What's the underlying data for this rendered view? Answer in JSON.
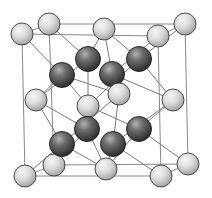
{
  "diagram": {
    "type": "crystal-unit-cell",
    "colors": {
      "background": "#ffffff",
      "edge": "#8a8a8a",
      "bond": "#7a7a7a",
      "light_atom_highlight": "#f4f4f4",
      "light_atom_shadow": "#9c9c9c",
      "dark_atom_highlight": "#a8a8a8",
      "dark_atom_shadow": "#2a2a2a"
    },
    "atom_radius": {
      "light": 11,
      "dark": 12.5
    },
    "cell_edges": [
      [
        49,
        24,
        185,
        24
      ],
      [
        22,
        34,
        158,
        36
      ],
      [
        49,
        24,
        22,
        34
      ],
      [
        185,
        24,
        158,
        36
      ],
      [
        54,
        165,
        188,
        164
      ],
      [
        25,
        176,
        161,
        176
      ],
      [
        54,
        165,
        25,
        176
      ],
      [
        188,
        164,
        161,
        176
      ],
      [
        22,
        34,
        25,
        176
      ],
      [
        49,
        24,
        54,
        165
      ],
      [
        158,
        36,
        161,
        176
      ],
      [
        185,
        24,
        188,
        164
      ]
    ],
    "bonds": [
      [
        88,
        59,
        49,
        24
      ],
      [
        88,
        59,
        104,
        29
      ],
      [
        88,
        59,
        36,
        100
      ],
      [
        88,
        59,
        88,
        106
      ],
      [
        62,
        75,
        22,
        34
      ],
      [
        62,
        75,
        36,
        100
      ],
      [
        62,
        75,
        119,
        94
      ],
      [
        62,
        75,
        88,
        106
      ],
      [
        139,
        59,
        185,
        24
      ],
      [
        139,
        59,
        104,
        29
      ],
      [
        139,
        59,
        173,
        100
      ],
      [
        139,
        59,
        88,
        106
      ],
      [
        112,
        74,
        104,
        29
      ],
      [
        112,
        74,
        158,
        36
      ],
      [
        112,
        74,
        119,
        94
      ],
      [
        112,
        74,
        173,
        100
      ],
      [
        87,
        129,
        88,
        106
      ],
      [
        87,
        129,
        36,
        100
      ],
      [
        87,
        129,
        54,
        165
      ],
      [
        87,
        129,
        106,
        169
      ],
      [
        62,
        144,
        36,
        100
      ],
      [
        62,
        144,
        25,
        176
      ],
      [
        62,
        144,
        119,
        94
      ],
      [
        62,
        144,
        106,
        169
      ],
      [
        139,
        129,
        88,
        106
      ],
      [
        139,
        129,
        173,
        100
      ],
      [
        139,
        129,
        188,
        164
      ],
      [
        139,
        129,
        106,
        169
      ],
      [
        113,
        144,
        119,
        94
      ],
      [
        113,
        144,
        173,
        100
      ],
      [
        113,
        144,
        161,
        176
      ],
      [
        113,
        144,
        106,
        169
      ]
    ],
    "back_light_atoms": [
      {
        "id": "back-top-left",
        "x": 49,
        "y": 24
      },
      {
        "id": "back-top-right",
        "x": 185,
        "y": 24
      },
      {
        "id": "back-bottom-left",
        "x": 54,
        "y": 165
      },
      {
        "id": "back-bottom-right",
        "x": 188,
        "y": 164
      },
      {
        "id": "back-face-center",
        "x": 88,
        "y": 106
      }
    ],
    "dark_atoms": [
      {
        "id": "tetra-1",
        "x": 88,
        "y": 59
      },
      {
        "id": "tetra-2",
        "x": 139,
        "y": 59
      },
      {
        "id": "tetra-3",
        "x": 87,
        "y": 129
      },
      {
        "id": "tetra-4",
        "x": 139,
        "y": 129
      },
      {
        "id": "tetra-5",
        "x": 62,
        "y": 75
      },
      {
        "id": "tetra-6",
        "x": 112,
        "y": 74
      },
      {
        "id": "tetra-7",
        "x": 62,
        "y": 144
      },
      {
        "id": "tetra-8",
        "x": 113,
        "y": 144
      }
    ],
    "front_light_atoms": [
      {
        "id": "top-face-center",
        "x": 104,
        "y": 29
      },
      {
        "id": "bottom-face-center",
        "x": 106,
        "y": 169
      },
      {
        "id": "left-face-center",
        "x": 36,
        "y": 100
      },
      {
        "id": "right-face-center",
        "x": 173,
        "y": 100
      },
      {
        "id": "front-face-center",
        "x": 119,
        "y": 94
      },
      {
        "id": "front-top-left",
        "x": 22,
        "y": 34
      },
      {
        "id": "front-top-right",
        "x": 158,
        "y": 36
      },
      {
        "id": "front-bottom-left",
        "x": 25,
        "y": 176
      },
      {
        "id": "front-bottom-right",
        "x": 161,
        "y": 176
      }
    ]
  }
}
